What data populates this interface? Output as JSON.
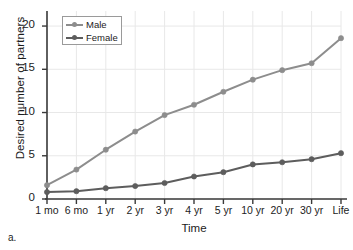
{
  "figure": {
    "caption_label": "a."
  },
  "legend": {
    "position": "top-left-inside",
    "entries": [
      {
        "label": "Male",
        "color": "#8d8d8d"
      },
      {
        "label": "Female",
        "color": "#5d5d5d"
      }
    ]
  },
  "axes": {
    "y_title": "Desired number of partners",
    "x_title": "Time",
    "y_ticks": [
      "0",
      "5",
      "10",
      "15",
      "20"
    ],
    "x_ticks": [
      "1 mo",
      "6 mo",
      "1 yr",
      "2 yr",
      "3 yr",
      "4 yr",
      "5 yr",
      "10 yr",
      "20 yr",
      "30 yr",
      "Life"
    ]
  },
  "chart_data": {
    "type": "line",
    "title": "",
    "xlabel": "Time",
    "ylabel": "Desired number of partners",
    "categories": [
      "1 mo",
      "6 mo",
      "1 yr",
      "2 yr",
      "3 yr",
      "4 yr",
      "5 yr",
      "10 yr",
      "20 yr",
      "30 yr",
      "Life"
    ],
    "series": [
      {
        "name": "Male",
        "color": "#8d8d8d",
        "values": [
          1.6,
          3.4,
          5.7,
          7.8,
          9.7,
          10.9,
          12.4,
          13.8,
          14.9,
          15.7,
          18.6
        ]
      },
      {
        "name": "Female",
        "color": "#5d5d5d",
        "values": [
          0.8,
          0.9,
          1.25,
          1.5,
          1.85,
          2.6,
          3.1,
          4.0,
          4.25,
          4.6,
          5.3
        ]
      }
    ],
    "ylim": [
      0,
      20.7
    ],
    "yticks": [
      0,
      5,
      10,
      15,
      20
    ],
    "grid": true,
    "grid_color": "#e8e8e8",
    "legend_position": "upper left"
  }
}
